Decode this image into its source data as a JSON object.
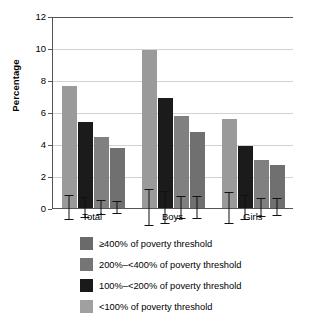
{
  "chart_data": {
    "type": "bar",
    "title": "",
    "xlabel": "",
    "ylabel": "Percentage",
    "ylim": [
      0,
      12
    ],
    "yticks": [
      "0",
      "2",
      "4",
      "6",
      "8",
      "10",
      "12"
    ],
    "grid": true,
    "legend_position": "bottom",
    "categories": [
      "Total",
      "Boys",
      "Girls"
    ],
    "series": [
      {
        "name": "≥400% of poverty threshold",
        "color": "#9a9a9a",
        "legend_color": "#6a6a6a",
        "values": [
          7.65,
          9.85,
          5.55
        ],
        "err_low": [
          6.9,
          8.7,
          4.55
        ],
        "err_high": [
          8.4,
          11.0,
          6.5
        ]
      },
      {
        "name": "200%–<400% of poverty threshold",
        "color": "#1b1b1b",
        "legend_color": "#757575",
        "values": [
          5.4,
          6.9,
          3.9
        ],
        "err_low": [
          4.8,
          5.9,
          3.15
        ],
        "err_high": [
          6.0,
          7.9,
          4.65
        ]
      },
      {
        "name": "100%–<200% of poverty threshold",
        "color": "#808080",
        "legend_color": "#1a1a1a",
        "values": [
          4.45,
          5.75,
          3.0
        ],
        "err_low": [
          4.0,
          5.05,
          2.45
        ],
        "err_high": [
          4.9,
          6.45,
          3.55
        ]
      },
      {
        "name": "<100% of poverty threshold",
        "color": "#707070",
        "legend_color": "#a0a0a0",
        "values": [
          3.75,
          4.75,
          2.7
        ],
        "err_low": [
          3.4,
          4.05,
          2.2
        ],
        "err_high": [
          4.15,
          5.45,
          3.25
        ]
      }
    ]
  },
  "legend": [
    {
      "label": "≥400% of poverty threshold",
      "color": "#6a6a6a"
    },
    {
      "label": "200%–<400% of poverty threshold",
      "color": "#757575"
    },
    {
      "label": "100%–<200% of poverty threshold",
      "color": "#1a1a1a"
    },
    {
      "label": "<100% of poverty threshold",
      "color": "#a0a0a0"
    }
  ]
}
